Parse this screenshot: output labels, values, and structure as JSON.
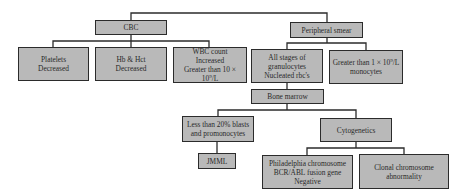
{
  "diagram": {
    "type": "flowchart",
    "colors": {
      "box_fill": "#b9b9b9",
      "box_border": "#2b2b2b",
      "line": "#2b2b2b",
      "text": "#2a2a2a"
    },
    "nodes": {
      "cbc": {
        "label": "CBC"
      },
      "peripheral_smear": {
        "label": "Peripheral smear"
      },
      "platelets": {
        "label": "Platelets\nDecreased"
      },
      "hb_hct": {
        "label": "Hb & Hct\nDecreased"
      },
      "wbc": {
        "line1": "WBC count",
        "line2": "Increased",
        "line3_prefix": "Greater than 10 × 10",
        "line3_sup": "9",
        "line3_suffix": "/L"
      },
      "all_stages": {
        "label": "All stages of\ngranulocytes\nNucleated rbc's"
      },
      "monocytes": {
        "line1_prefix": "Greater than 1 × 10",
        "line1_sup": "9",
        "line1_suffix": "/L",
        "line2": "monocytes"
      },
      "bone_marrow": {
        "label": "Bone marrow"
      },
      "blasts": {
        "label": "Less than 20% blasts\nand promonocytes"
      },
      "cytogenetics": {
        "label": "Cytogenetics"
      },
      "jmml": {
        "label": "JMML"
      },
      "philadelphia": {
        "label": "Philadelphia chromosome\nBCR/ABL fusion gene\nNegative"
      },
      "clonal": {
        "label": "Clonal chromosome\nabnormality"
      }
    },
    "edges": [
      [
        "cbc",
        "peripheral_smear"
      ],
      [
        "cbc",
        "platelets"
      ],
      [
        "cbc",
        "hb_hct"
      ],
      [
        "cbc",
        "wbc"
      ],
      [
        "peripheral_smear",
        "all_stages"
      ],
      [
        "peripheral_smear",
        "monocytes"
      ],
      [
        "all_stages",
        "bone_marrow"
      ],
      [
        "bone_marrow",
        "blasts"
      ],
      [
        "bone_marrow",
        "cytogenetics"
      ],
      [
        "blasts",
        "jmml"
      ],
      [
        "cytogenetics",
        "philadelphia"
      ],
      [
        "cytogenetics",
        "clonal"
      ]
    ]
  }
}
